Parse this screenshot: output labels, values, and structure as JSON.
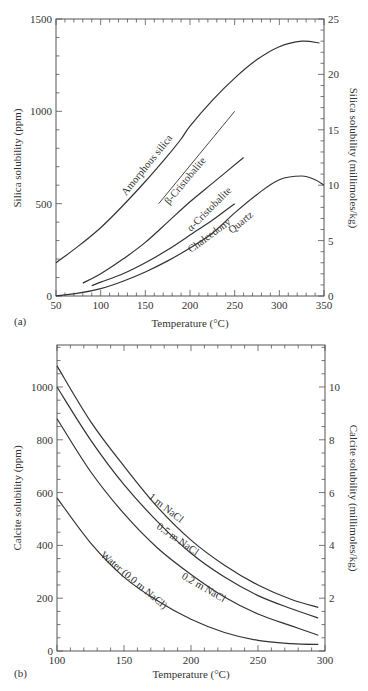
{
  "panels": [
    {
      "id": "a",
      "panel_label": "(a)",
      "xlabel": "Temperature (°C)",
      "ylabel_left": "Silica solubility (ppm)",
      "ylabel_right": "Silica solubility (millimoles/kg)",
      "x_ticks": [
        "50",
        "100",
        "150",
        "200",
        "250",
        "300",
        "350"
      ],
      "y_left_ticks": [
        "0",
        "500",
        "1000",
        "1500"
      ],
      "y_right_ticks": [
        "0",
        "5",
        "10",
        "15",
        "20",
        "25"
      ],
      "curve_labels": [
        "Amorphous silica",
        "β-Cristobalite",
        "α-Cristobalite",
        "Chalcedony",
        "Quartz"
      ]
    },
    {
      "id": "b",
      "panel_label": "(b)",
      "xlabel": "Temperature (°C)",
      "ylabel_left": "Calcite solubility (ppm)",
      "ylabel_right": "Calcite solubility (millimoles/kg)",
      "x_ticks": [
        "100",
        "150",
        "200",
        "250",
        "300"
      ],
      "y_left_ticks": [
        "0",
        "200",
        "400",
        "600",
        "800",
        "1000"
      ],
      "y_right_ticks": [
        "2",
        "4",
        "6",
        "8",
        "10"
      ],
      "curve_labels": [
        "1 m NaCl",
        "0.5 m NaCl",
        "0.2 m NaCl",
        "Water (0.0 m NaCl)"
      ]
    }
  ],
  "chart_data": [
    {
      "type": "line",
      "title": "(a)",
      "xlabel": "Temperature (°C)",
      "ylabel": "Silica solubility (ppm)",
      "ylabel_secondary": "Silica solubility (millimoles/kg)",
      "xlim": [
        50,
        350
      ],
      "ylim": [
        0,
        1500
      ],
      "ylim_secondary": [
        0,
        25
      ],
      "grid": false,
      "legend": "inline curve labels",
      "series": [
        {
          "name": "Amorphous silica",
          "x": [
            50,
            75,
            100,
            125,
            150,
            175,
            190,
            200,
            225,
            250,
            275,
            300,
            325,
            345
          ],
          "y": [
            180,
            270,
            370,
            490,
            620,
            760,
            850,
            920,
            1060,
            1180,
            1280,
            1350,
            1380,
            1370
          ]
        },
        {
          "name": "β-Cristobalite",
          "x": [
            165,
            250
          ],
          "y": [
            500,
            1000
          ]
        },
        {
          "name": "α-Cristobalite",
          "x": [
            80,
            100,
            125,
            150,
            175,
            200,
            225,
            260
          ],
          "y": [
            70,
            120,
            200,
            290,
            400,
            510,
            610,
            750
          ]
        },
        {
          "name": "Chalcedony",
          "x": [
            90,
            100,
            125,
            150,
            175,
            200,
            225,
            250
          ],
          "y": [
            55,
            75,
            120,
            180,
            250,
            330,
            410,
            500
          ]
        },
        {
          "name": "Quartz",
          "x": [
            50,
            75,
            100,
            125,
            150,
            175,
            200,
            225,
            250,
            275,
            300,
            325,
            340,
            350
          ],
          "y": [
            0,
            15,
            40,
            80,
            130,
            190,
            260,
            340,
            450,
            550,
            630,
            650,
            630,
            600
          ]
        }
      ]
    },
    {
      "type": "line",
      "title": "(b)",
      "xlabel": "Temperature (°C)",
      "ylabel": "Calcite solubility (ppm)",
      "ylabel_secondary": "Calcite solubility (millimoles/kg)",
      "xlim": [
        100,
        300
      ],
      "ylim": [
        0,
        1150
      ],
      "grid": false,
      "legend": "inline curve labels",
      "series": [
        {
          "name": "1 m NaCl",
          "x": [
            100,
            125,
            150,
            175,
            200,
            225,
            250,
            275,
            295
          ],
          "y": [
            1080,
            870,
            700,
            545,
            420,
            325,
            250,
            195,
            165
          ]
        },
        {
          "name": "0.5 m NaCl",
          "x": [
            100,
            125,
            150,
            175,
            200,
            225,
            250,
            275,
            295
          ],
          "y": [
            1000,
            800,
            630,
            490,
            370,
            280,
            210,
            160,
            125
          ]
        },
        {
          "name": "0.2 m NaCl",
          "x": [
            100,
            125,
            150,
            175,
            200,
            225,
            250,
            275,
            295
          ],
          "y": [
            880,
            680,
            520,
            390,
            290,
            205,
            140,
            95,
            60
          ]
        },
        {
          "name": "Water (0.0 m NaCl)",
          "x": [
            100,
            125,
            150,
            175,
            200,
            225,
            250,
            275,
            295
          ],
          "y": [
            580,
            410,
            280,
            190,
            120,
            70,
            40,
            28,
            25
          ]
        }
      ]
    }
  ]
}
